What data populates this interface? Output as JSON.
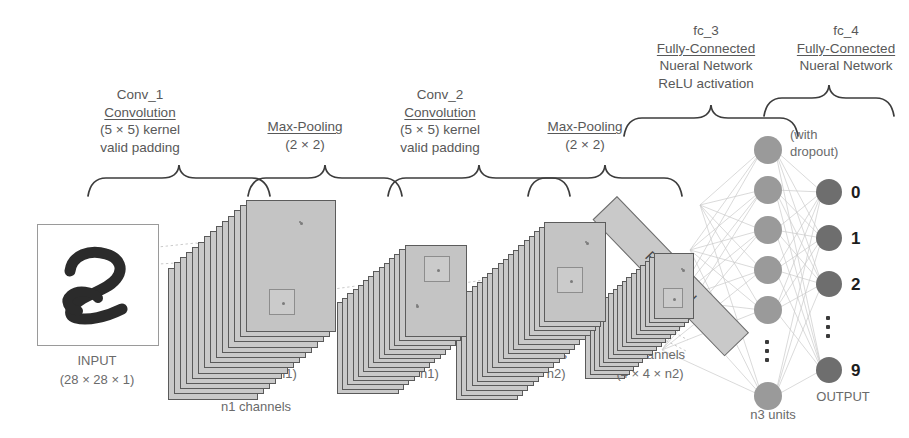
{
  "diagram": {
    "top_labels": [
      {
        "name": "conv_1",
        "lines": [
          "Conv_1",
          "Convolution",
          "(5 × 5) kernel",
          "valid padding"
        ],
        "underline_index": 1
      },
      {
        "name": "maxpool_1",
        "lines": [
          "Max-Pooling",
          "(2 × 2)"
        ],
        "underline_index": 0
      },
      {
        "name": "conv_2",
        "lines": [
          "Conv_2",
          "Convolution",
          "(5 × 5) kernel",
          "valid padding"
        ],
        "underline_index": 1
      },
      {
        "name": "maxpool_2",
        "lines": [
          "Max-Pooling",
          "(2 × 2)"
        ],
        "underline_index": 0
      },
      {
        "name": "fc_3",
        "lines": [
          "fc_3",
          "Fully-Connected",
          "Nueral Network",
          "ReLU activation"
        ],
        "underline_index": 1
      },
      {
        "name": "fc_4",
        "lines": [
          "fc_4",
          "Fully-Connected",
          "Nueral Network"
        ],
        "underline_index": 1
      }
    ],
    "bottom_labels": [
      {
        "name": "input",
        "lines": [
          "INPUT",
          "(28 × 28 × 1)"
        ]
      },
      {
        "name": "conv1_out",
        "lines": [
          "n1 channels",
          "(24 × 24 × n1)",
          "n1 channels"
        ]
      },
      {
        "name": "pool1_out",
        "lines": [
          "n1 channels",
          "(12 × 12 × n1)"
        ]
      },
      {
        "name": "conv2_out",
        "lines": [
          "n2 channels",
          "(8 × 8 × n2)"
        ]
      },
      {
        "name": "pool2_out",
        "lines": [
          "n2 channels",
          "(4 × 4 × n2)"
        ]
      }
    ],
    "flattened_label": "Flattened",
    "dropout_note": "(with\ndropout)",
    "dropout_line1": "(with",
    "dropout_line2": "dropout)",
    "hidden_units_label": "n3 units",
    "output_label": "OUTPUT",
    "output_classes": [
      "0",
      "1",
      "2",
      "9"
    ],
    "output_ellipsis_after": 2,
    "layers": {
      "conv1_channels": 14,
      "pool1_channels": 14,
      "conv2_channels": 18,
      "pool2_channels": 16,
      "hidden_nodes_visible": 6,
      "output_nodes_visible": 4
    },
    "colors": {
      "card_fill": "#c9c9c9",
      "card_edge": "#5a5a5a",
      "hidden_node": "#9a9a9a",
      "output_node": "#6e6e6e",
      "text": "#585858",
      "digit_text": "#1d1d1d",
      "connection": "#c0c0c0",
      "background": "#ffffff"
    }
  }
}
